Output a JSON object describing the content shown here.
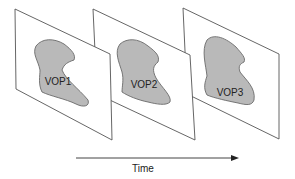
{
  "diagram": {
    "type": "video-object-planes-sequence",
    "planes": [
      {
        "label": "VOP1"
      },
      {
        "label": "VOP2"
      },
      {
        "label": "VOP3"
      }
    ],
    "axis": {
      "label": "Time",
      "direction": "left-to-right"
    },
    "colors": {
      "plane_fill": "#ffffff",
      "plane_stroke": "#555555",
      "object_fill": "#b9b9b9",
      "object_stroke": "#6a6a6a",
      "arrow": "#444444"
    }
  }
}
